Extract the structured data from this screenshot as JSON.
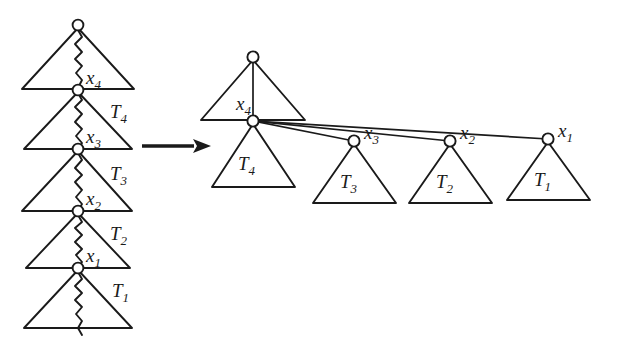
{
  "figure": {
    "transform_arrow": "right-arrow",
    "colors": {
      "ink": "#1a1a1a",
      "background": "#ffffff"
    }
  },
  "left_tree": {
    "name": "linear-chain-tree",
    "description": "Deeply nested left-leaning chain of subtrees",
    "nodes": [
      {
        "id": "root",
        "label": "",
        "cx": 78,
        "cy": 25
      },
      {
        "id": "x4",
        "label": "x",
        "sub": "4",
        "cx": 78,
        "cy": 90,
        "label_x": 86,
        "label_y": 84
      },
      {
        "id": "x3",
        "label": "x",
        "sub": "3",
        "cx": 78,
        "cy": 149,
        "label_x": 86,
        "label_y": 143
      },
      {
        "id": "x2",
        "label": "x",
        "sub": "2",
        "cx": 78,
        "cy": 211,
        "label_x": 86,
        "label_y": 205
      },
      {
        "id": "x1",
        "label": "x",
        "sub": "1",
        "cx": 78,
        "cy": 268,
        "label_x": 86,
        "label_y": 262
      }
    ],
    "subtree_labels": [
      {
        "id": "T4",
        "label": "T",
        "sub": "4",
        "x": 110,
        "y": 118
      },
      {
        "id": "T3",
        "label": "T",
        "sub": "3",
        "x": 110,
        "y": 180
      },
      {
        "id": "T2",
        "label": "T",
        "sub": "2",
        "x": 110,
        "y": 240
      },
      {
        "id": "T1",
        "label": "T",
        "sub": "1",
        "x": 112,
        "y": 297
      }
    ],
    "triangles": [
      {
        "id": "tri-top",
        "apex_x": 78,
        "apex_y": 28,
        "base_y": 89,
        "left_x": 22,
        "right_x": 134
      },
      {
        "id": "tri-T4",
        "apex_x": 78,
        "apex_y": 92,
        "base_y": 149,
        "left_x": 24,
        "right_x": 132
      },
      {
        "id": "tri-T3",
        "apex_x": 78,
        "apex_y": 151,
        "base_y": 211,
        "left_x": 22,
        "right_x": 132
      },
      {
        "id": "tri-T2",
        "apex_x": 78,
        "apex_y": 213,
        "base_y": 268,
        "left_x": 26,
        "right_x": 130
      },
      {
        "id": "tri-T1",
        "apex_x": 78,
        "apex_y": 270,
        "base_y": 328,
        "left_x": 24,
        "right_x": 132
      }
    ]
  },
  "right_tree": {
    "name": "splayed-tree",
    "description": "Flattened tree after splay: x4 at top with x3, x2, x1 as right children",
    "nodes": [
      {
        "id": "root",
        "label": "",
        "cx": 253,
        "cy": 57
      },
      {
        "id": "x4",
        "label": "x",
        "sub": "4",
        "cx": 253,
        "cy": 121,
        "label_x": 238,
        "label_y": 110
      },
      {
        "id": "x3",
        "label": "x",
        "sub": "3",
        "cx": 354,
        "cy": 141,
        "label_x": 364,
        "label_y": 137
      },
      {
        "id": "x2",
        "label": "x",
        "sub": "2",
        "cx": 450,
        "cy": 141,
        "label_x": 460,
        "label_y": 137
      },
      {
        "id": "x1",
        "label": "x",
        "sub": "1",
        "cx": 548,
        "cy": 139,
        "label_x": 558,
        "label_y": 135
      }
    ],
    "subtree_labels": [
      {
        "id": "T4",
        "label": "T",
        "sub": "4",
        "x": 240,
        "y": 163
      },
      {
        "id": "T3",
        "label": "T",
        "sub": "3",
        "x": 342,
        "y": 184
      },
      {
        "id": "T2",
        "label": "T",
        "sub": "2",
        "x": 438,
        "y": 184
      },
      {
        "id": "T1",
        "label": "T",
        "sub": "1",
        "x": 536,
        "y": 182
      }
    ],
    "triangles": [
      {
        "id": "tri-top",
        "apex_x": 253,
        "apex_y": 60,
        "base_y": 120,
        "left_x": 201,
        "right_x": 305
      },
      {
        "id": "tri-T4",
        "apex_x": 253,
        "apex_y": 124,
        "base_y": 187,
        "left_x": 212,
        "right_x": 295
      },
      {
        "id": "tri-T3",
        "apex_x": 354,
        "apex_y": 144,
        "base_y": 203,
        "left_x": 313,
        "right_x": 396
      },
      {
        "id": "tri-T2",
        "apex_x": 450,
        "apex_y": 144,
        "base_y": 203,
        "left_x": 409,
        "right_x": 492
      },
      {
        "id": "tri-T1",
        "apex_x": 548,
        "apex_y": 142,
        "base_y": 200,
        "left_x": 507,
        "right_x": 590
      }
    ],
    "edges": [
      {
        "from": "x4",
        "to": "x3"
      },
      {
        "from": "x4",
        "to": "x2"
      },
      {
        "from": "x4",
        "to": "x1"
      }
    ]
  },
  "arrow": {
    "name": "transform-arrow",
    "x1": 142,
    "x2": 205,
    "y": 146
  }
}
